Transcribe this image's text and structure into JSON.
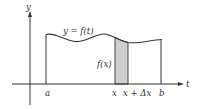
{
  "diagram": {
    "axes": {
      "vertical_label": "y",
      "horizontal_label": "t"
    },
    "curve_label": "y = f(t)",
    "strip_height_label": "f(x)",
    "tick_labels": {
      "a": "a",
      "x": "x",
      "x_plus_dx": "x + Δx",
      "b": "b"
    },
    "colors": {
      "line": "#333333",
      "strip_fill": "#cfcfcf",
      "background": "#ffffff"
    }
  }
}
